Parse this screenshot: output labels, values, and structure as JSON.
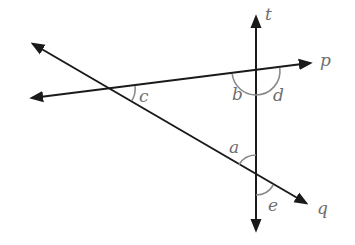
{
  "diagram": {
    "colors": {
      "line": "#1a1a1a",
      "arc": "#8a8a8a",
      "label": "#6e6e6e",
      "background": "#ffffff"
    },
    "lines": [
      {
        "name": "t",
        "label": "t",
        "from": [
          256,
          232
        ],
        "to": [
          256,
          15
        ]
      },
      {
        "name": "p",
        "label": "p",
        "from": [
          30,
          98
        ],
        "to": [
          312,
          63
        ]
      },
      {
        "name": "q",
        "label": "q",
        "from": [
          31,
          43
        ],
        "to": [
          308,
          204
        ]
      }
    ],
    "intersections": {
      "p_q": [
        112,
        89
      ],
      "p_t": [
        256,
        71
      ],
      "q_t": [
        256,
        175
      ]
    },
    "angles": [
      {
        "name": "a",
        "label": "a",
        "vertex": "q_t",
        "position": "above q, left of t"
      },
      {
        "name": "b",
        "label": "b",
        "vertex": "p_t",
        "position": "below p, left of t"
      },
      {
        "name": "c",
        "label": "c",
        "vertex": "p_q",
        "position": "below p, above q (right side)"
      },
      {
        "name": "d",
        "label": "d",
        "vertex": "p_t",
        "position": "below p, right of t"
      },
      {
        "name": "e",
        "label": "e",
        "vertex": "q_t",
        "position": "below q, right of t"
      }
    ],
    "labels": {
      "t": "t",
      "p": "p",
      "q": "q",
      "a": "a",
      "b": "b",
      "c": "c",
      "d": "d",
      "e": "e"
    }
  }
}
